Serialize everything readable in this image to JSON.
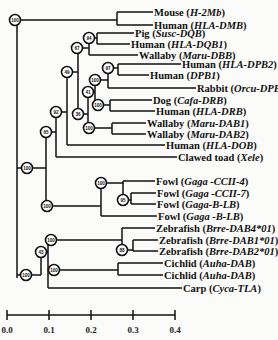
{
  "figure": {
    "type": "phylogenetic-tree",
    "colors": {
      "line": "#111111",
      "background": "#fbfbfa",
      "node_fill": "#ffffff"
    }
  },
  "leaves": [
    {
      "species": "Mouse",
      "gene": "H-2Mb",
      "y": 12,
      "x_end": 153
    },
    {
      "species": "Human",
      "gene": "HLA-DMB",
      "y": 25,
      "x_end": 153
    },
    {
      "species": "Pig",
      "gene": "Susc-DQB",
      "y": 33,
      "x_end": 134
    },
    {
      "species": "Human",
      "gene": "HLA-DQB1",
      "y": 44,
      "x_end": 130
    },
    {
      "species": "Wallaby",
      "gene": "Maru-DBB",
      "y": 55,
      "x_end": 138
    },
    {
      "species": "Human",
      "gene": "HLA-DPB2",
      "y": 64,
      "x_end": 181
    },
    {
      "species": "Human",
      "gene": "DPB1",
      "y": 75,
      "x_end": 149
    },
    {
      "species": "Rabbit",
      "gene": "Orcu-DPB",
      "y": 88,
      "x_end": 196
    },
    {
      "species": "Dog",
      "gene": "Cafa-DRB",
      "y": 100,
      "x_end": 152
    },
    {
      "species": "Human",
      "gene": "HLA-DRB",
      "y": 111,
      "x_end": 155
    },
    {
      "species": "Wallaby",
      "gene": "Maru-DAB1",
      "y": 123,
      "x_end": 146
    },
    {
      "species": "Wallaby",
      "gene": "Maru-DAB2",
      "y": 134,
      "x_end": 146
    },
    {
      "species": "Human",
      "gene": "HLA-DOB",
      "y": 145,
      "x_end": 165
    },
    {
      "species": "Clawed toad",
      "gene": "Xele",
      "y": 157,
      "x_end": 177
    },
    {
      "species": "Fowl",
      "gene": "Gaga -CCII-4",
      "y": 181,
      "x_end": 155
    },
    {
      "species": "Fowl",
      "gene": "Gaga -CCII-7",
      "y": 193,
      "x_end": 156
    },
    {
      "species": "Fowl",
      "gene": "Gaga-B-LB",
      "y": 204,
      "x_end": 156
    },
    {
      "species": "Fowl",
      "gene": "Gaga -B-LB",
      "y": 216,
      "x_end": 157
    },
    {
      "species": "Zebrafish",
      "gene": "Brre-DAB4*01",
      "y": 228,
      "x_end": 155
    },
    {
      "species": "Zebrafish",
      "gene": "Brre-DAB1*01",
      "y": 240,
      "x_end": 158
    },
    {
      "species": "Zebrafish",
      "gene": "Brre-DAB2*01",
      "y": 251,
      "x_end": 158
    },
    {
      "species": "Cichlid",
      "gene": "Auha-DAB",
      "y": 263,
      "x_end": 163
    },
    {
      "species": "Cichlid",
      "gene": "Auha-DAB",
      "y": 275,
      "x_end": 163
    },
    {
      "species": "Carp",
      "gene": "Cyca-TLA",
      "y": 288,
      "x_end": 182
    }
  ],
  "nodes": [
    {
      "id": "root",
      "support": "100",
      "x": 15,
      "y": 20
    },
    {
      "id": "n94",
      "support": "94",
      "x": 89,
      "y": 38
    },
    {
      "id": "n67",
      "support": "67",
      "x": 77,
      "y": 48
    },
    {
      "id": "n49",
      "support": "49",
      "x": 67,
      "y": 72
    },
    {
      "id": "n97",
      "support": "97",
      "x": 108,
      "y": 68
    },
    {
      "id": "n100dp",
      "support": "100",
      "x": 95,
      "y": 80
    },
    {
      "id": "n41",
      "support": "41",
      "x": 88,
      "y": 92
    },
    {
      "id": "n100dr",
      "support": "100",
      "x": 98,
      "y": 105
    },
    {
      "id": "n36",
      "support": "36",
      "x": 78,
      "y": 114
    },
    {
      "id": "n92",
      "support": "92",
      "x": 56,
      "y": 112
    },
    {
      "id": "n100da",
      "support": "100",
      "x": 89,
      "y": 128
    },
    {
      "id": "n65",
      "support": "65",
      "x": 46,
      "y": 132
    },
    {
      "id": "n100a",
      "support": "100",
      "x": 27,
      "y": 168
    },
    {
      "id": "n100f",
      "support": "100",
      "x": 101,
      "y": 183
    },
    {
      "id": "n95",
      "support": "95",
      "x": 123,
      "y": 200
    },
    {
      "id": "n100b",
      "support": "100",
      "x": 47,
      "y": 206
    },
    {
      "id": "n100z",
      "support": "100",
      "x": 51,
      "y": 240
    },
    {
      "id": "n88",
      "support": "88",
      "x": 122,
      "y": 250
    },
    {
      "id": "n43",
      "support": "43",
      "x": 41,
      "y": 252
    },
    {
      "id": "n100c",
      "support": "100",
      "x": 54,
      "y": 270
    },
    {
      "id": "n100r",
      "support": "100",
      "x": 26,
      "y": 275
    }
  ],
  "scale_bar": {
    "ticks": [
      "0.0",
      "0.1",
      "0.2",
      "0.3",
      "0.4"
    ],
    "x_start": 7,
    "x_end": 175,
    "y": 315
  }
}
